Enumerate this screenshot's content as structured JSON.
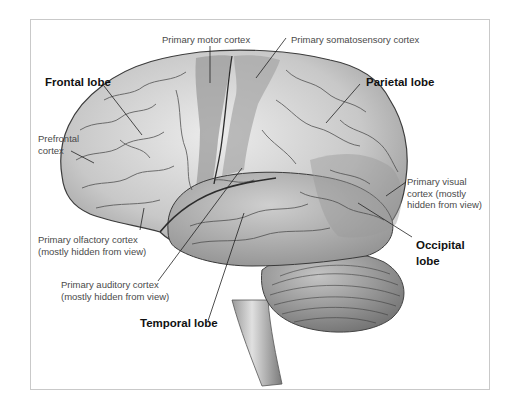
{
  "diagram": {
    "title": "",
    "colors": {
      "frame_border": "#c9c9c9",
      "brain_light": "#e2e2e2",
      "brain_mid": "#b8b8b8",
      "brain_dark": "#8a8a8a",
      "highlight_regions": "#9a9a9a",
      "leader_lines": "#222222",
      "label_text": "#4a4a4a",
      "bold_label_text": "#111111"
    },
    "labels": {
      "primary_motor_cortex": "Primary motor cortex",
      "primary_somatosensory_cortex": "Primary somatosensory cortex",
      "frontal_lobe": "Frontal lobe",
      "parietal_lobe": "Parietal lobe",
      "prefrontal_cortex_line1": "Prefrontal",
      "prefrontal_cortex_line2": "cortex",
      "primary_visual_cortex_line1": "Primary visual",
      "primary_visual_cortex_line2": "cortex (mostly",
      "primary_visual_cortex_line3": "hidden from view)",
      "primary_olfactory_cortex_line1": "Primary olfactory cortex",
      "primary_olfactory_cortex_line2": "(mostly hidden from view)",
      "occipital_lobe_line1": "Occipital",
      "occipital_lobe_line2": "lobe",
      "primary_auditory_cortex_line1": "Primary auditory cortex",
      "primary_auditory_cortex_line2": "(mostly hidden from view)",
      "temporal_lobe": "Temporal lobe"
    }
  }
}
